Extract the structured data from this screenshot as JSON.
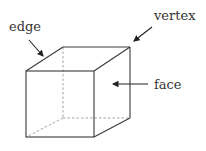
{
  "diagram": {
    "labels": {
      "edge": "edge",
      "vertex": "vertex",
      "face": "face"
    },
    "colors": {
      "line": "#3a3a3a",
      "hidden_line": "#9a9a9a",
      "text": "#333333"
    }
  }
}
